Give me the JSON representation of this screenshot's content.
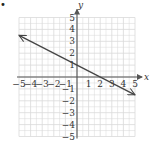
{
  "marker": "•",
  "chart_data": {
    "type": "line",
    "title": "",
    "xlabel": "x",
    "ylabel": "y",
    "xlim": [
      -5,
      5
    ],
    "ylim": [
      -5,
      5
    ],
    "grid": true,
    "x_ticks": [
      -5,
      -4,
      -3,
      -2,
      -1,
      1,
      2,
      3,
      4,
      5
    ],
    "y_ticks": [
      5,
      4,
      3,
      2,
      1,
      -1,
      -2,
      -3,
      -4,
      -5
    ],
    "x_tick_labels": [
      "−5",
      "−4",
      "−3",
      "−2",
      "−1",
      "1",
      "2",
      "3",
      "4",
      "5"
    ],
    "y_tick_labels": [
      "5",
      "4",
      "3",
      "2",
      "1",
      "−1",
      "−2",
      "−3",
      "−4",
      "−5"
    ],
    "series": [
      {
        "name": "line",
        "equation": "y = -x/2 + 1",
        "x": [
          -5,
          5
        ],
        "y": [
          3.5,
          -1.5
        ],
        "arrows": "both",
        "color": "#444444"
      }
    ]
  },
  "colors": {
    "grid": "#d9d9d9",
    "axis": "#555555",
    "line": "#444444"
  }
}
